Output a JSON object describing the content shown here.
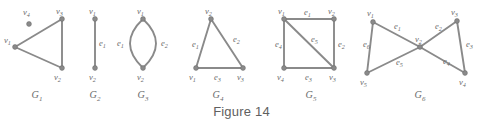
{
  "figure": {
    "caption": "Figure 14",
    "colors": {
      "edge": "#8a8a8a",
      "vertex": "#8a8a8a",
      "label_text": "#6b6b6b",
      "caption_text": "#606060",
      "background": "#ffffff"
    }
  },
  "graphs": [
    {
      "id": "G1",
      "name": "G",
      "subscript": "1",
      "label_x": 37,
      "label_y": 98,
      "vertices": [
        {
          "name": "v",
          "subscript": "1",
          "x": 15,
          "y": 47,
          "label_x": 4,
          "label_y": 43
        },
        {
          "name": "v",
          "subscript": "2",
          "x": 62,
          "y": 68,
          "label_x": 54,
          "label_y": 80
        },
        {
          "name": "v",
          "subscript": "3",
          "x": 62,
          "y": 19,
          "label_x": 56,
          "label_y": 14
        },
        {
          "name": "v",
          "subscript": "4",
          "x": 29,
          "y": 24,
          "label_x": 23,
          "label_y": 15
        }
      ],
      "edges": [
        {
          "type": "line",
          "from": 0,
          "to": 2,
          "label": null
        },
        {
          "type": "line",
          "from": 0,
          "to": 1,
          "label": null
        },
        {
          "type": "line",
          "from": 2,
          "to": 1,
          "label": null
        }
      ]
    },
    {
      "id": "G2",
      "name": "G",
      "subscript": "2",
      "label_x": 95,
      "label_y": 98,
      "vertices": [
        {
          "name": "v",
          "subscript": "1",
          "x": 95,
          "y": 19,
          "label_x": 89,
          "label_y": 14
        },
        {
          "name": "v",
          "subscript": "2",
          "x": 95,
          "y": 68,
          "label_x": 89,
          "label_y": 80
        }
      ],
      "edges": [
        {
          "type": "line",
          "from": 0,
          "to": 1,
          "label": {
            "name": "e",
            "subscript": "1",
            "x": 99,
            "y": 46
          }
        }
      ]
    },
    {
      "id": "G3",
      "name": "G",
      "subscript": "3",
      "label_x": 143,
      "label_y": 98,
      "vertices": [
        {
          "name": "v",
          "subscript": "1",
          "x": 143,
          "y": 19,
          "label_x": 137,
          "label_y": 14
        },
        {
          "name": "v",
          "subscript": "2",
          "x": 143,
          "y": 68,
          "label_x": 137,
          "label_y": 80
        }
      ],
      "edges": [
        {
          "type": "curve",
          "from": 0,
          "to": 1,
          "bow": -13,
          "label": {
            "name": "e",
            "subscript": "1",
            "x": 117,
            "y": 46
          }
        },
        {
          "type": "curve",
          "from": 0,
          "to": 1,
          "bow": 13,
          "label": {
            "name": "e",
            "subscript": "2",
            "x": 161,
            "y": 46
          }
        }
      ]
    },
    {
      "id": "G4",
      "name": "G",
      "subscript": "4",
      "label_x": 218,
      "label_y": 98,
      "vertices": [
        {
          "name": "v",
          "subscript": "1",
          "x": 196,
          "y": 68,
          "label_x": 189,
          "label_y": 80
        },
        {
          "name": "v",
          "subscript": "2",
          "x": 211,
          "y": 19,
          "label_x": 205,
          "label_y": 14
        },
        {
          "name": "v",
          "subscript": "3",
          "x": 243,
          "y": 68,
          "label_x": 237,
          "label_y": 80
        }
      ],
      "edges": [
        {
          "type": "line",
          "from": 0,
          "to": 1,
          "label": {
            "name": "e",
            "subscript": "1",
            "x": 192,
            "y": 47
          }
        },
        {
          "type": "line",
          "from": 1,
          "to": 2,
          "label": {
            "name": "e",
            "subscript": "2",
            "x": 233,
            "y": 42
          }
        },
        {
          "type": "line",
          "from": 0,
          "to": 2,
          "label": {
            "name": "e",
            "subscript": "3",
            "x": 214,
            "y": 80
          }
        }
      ]
    },
    {
      "id": "G5",
      "name": "G",
      "subscript": "5",
      "label_x": 311,
      "label_y": 98,
      "vertices": [
        {
          "name": "v",
          "subscript": "1",
          "x": 284,
          "y": 19,
          "label_x": 278,
          "label_y": 14
        },
        {
          "name": "v",
          "subscript": "2",
          "x": 334,
          "y": 19,
          "label_x": 328,
          "label_y": 14
        },
        {
          "name": "v",
          "subscript": "3",
          "x": 334,
          "y": 68,
          "label_x": 329,
          "label_y": 80
        },
        {
          "name": "v",
          "subscript": "4",
          "x": 284,
          "y": 68,
          "label_x": 277,
          "label_y": 80
        }
      ],
      "edges": [
        {
          "type": "line",
          "from": 0,
          "to": 1,
          "label": {
            "name": "e",
            "subscript": "1",
            "x": 304,
            "y": 15
          }
        },
        {
          "type": "line",
          "from": 1,
          "to": 2,
          "label": {
            "name": "e",
            "subscript": "2",
            "x": 338,
            "y": 47
          }
        },
        {
          "type": "line",
          "from": 3,
          "to": 2,
          "label": {
            "name": "e",
            "subscript": "3",
            "x": 305,
            "y": 80
          }
        },
        {
          "type": "line",
          "from": 0,
          "to": 3,
          "label": {
            "name": "e",
            "subscript": "4",
            "x": 275,
            "y": 47
          }
        },
        {
          "type": "line",
          "from": 0,
          "to": 2,
          "label": {
            "name": "e",
            "subscript": "5",
            "x": 311,
            "y": 42
          }
        }
      ]
    },
    {
      "id": "G6",
      "name": "G",
      "subscript": "6",
      "label_x": 420,
      "label_y": 98,
      "vertices": [
        {
          "name": "v",
          "subscript": "1",
          "x": 373,
          "y": 22,
          "label_x": 367,
          "label_y": 16
        },
        {
          "name": "v",
          "subscript": "2",
          "x": 420,
          "y": 47,
          "label_x": 415,
          "label_y": 42
        },
        {
          "name": "v",
          "subscript": "3",
          "x": 457,
          "y": 21,
          "label_x": 451,
          "label_y": 15
        },
        {
          "name": "v",
          "subscript": "4",
          "x": 465,
          "y": 73,
          "label_x": 459,
          "label_y": 85
        },
        {
          "name": "v",
          "subscript": "5",
          "x": 367,
          "y": 73,
          "label_x": 360,
          "label_y": 85
        }
      ],
      "edges": [
        {
          "type": "line",
          "from": 0,
          "to": 1,
          "label": {
            "name": "e",
            "subscript": "1",
            "x": 394,
            "y": 29
          }
        },
        {
          "type": "line",
          "from": 1,
          "to": 2,
          "label": {
            "name": "e",
            "subscript": "2",
            "x": 435,
            "y": 29
          }
        },
        {
          "type": "line",
          "from": 2,
          "to": 3,
          "label": {
            "name": "e",
            "subscript": "3",
            "x": 466,
            "y": 47
          }
        },
        {
          "type": "line",
          "from": 1,
          "to": 3,
          "label": {
            "name": "e",
            "subscript": "4",
            "x": 443,
            "y": 64
          }
        },
        {
          "type": "line",
          "from": 4,
          "to": 1,
          "label": {
            "name": "e",
            "subscript": "5",
            "x": 396,
            "y": 65
          }
        },
        {
          "type": "line",
          "from": 4,
          "to": 0,
          "label": {
            "name": "e",
            "subscript": "6",
            "x": 363,
            "y": 47
          }
        }
      ]
    }
  ]
}
